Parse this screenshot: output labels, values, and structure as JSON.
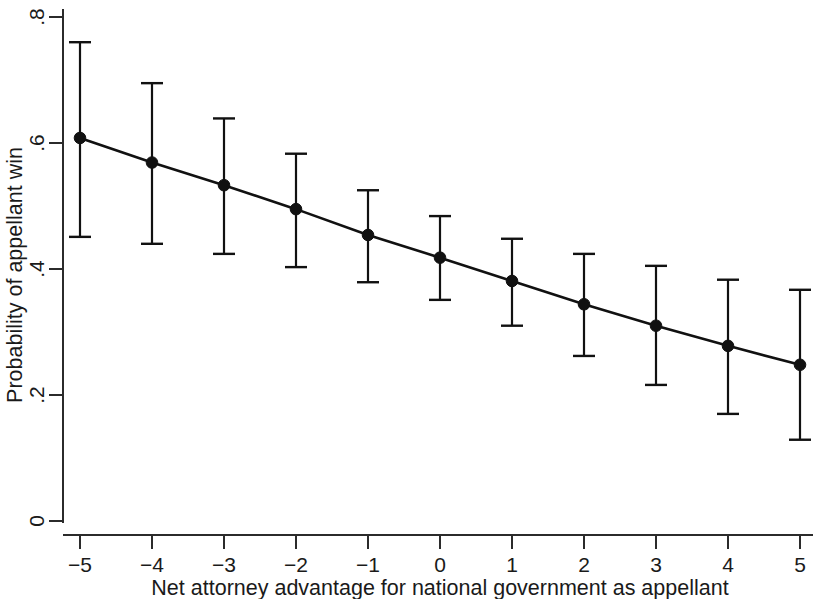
{
  "chart_data": {
    "type": "line",
    "title": "",
    "subtitle": "",
    "xlabel": "Net attorney advantage for national government as appellant",
    "ylabel": "Probability of appellant win",
    "x": [
      -5,
      -4,
      -3,
      -2,
      -1,
      0,
      1,
      2,
      3,
      4,
      5
    ],
    "xticklabels": [
      "−5",
      "−4",
      "−3",
      "−2",
      "−1",
      "0",
      "1",
      "2",
      "3",
      "4",
      "5"
    ],
    "yticklabels": [
      "0",
      ".2",
      ".4",
      ".6",
      ".8"
    ],
    "yticks": [
      0,
      0.2,
      0.4,
      0.6,
      0.8
    ],
    "xlim": [
      -5.35,
      5.2
    ],
    "ylim": [
      0,
      0.8
    ],
    "grid": false,
    "legend": null,
    "marker": "filled-circle",
    "errorbars": true,
    "series": [
      {
        "name": "Predicted probability of appellant win",
        "values": [
          0.608,
          0.569,
          0.533,
          0.495,
          0.454,
          0.418,
          0.381,
          0.344,
          0.31,
          0.278,
          0.248
        ],
        "ci_lower": [
          0.451,
          0.44,
          0.424,
          0.403,
          0.379,
          0.351,
          0.31,
          0.262,
          0.216,
          0.17,
          0.129
        ],
        "ci_upper": [
          0.76,
          0.695,
          0.639,
          0.583,
          0.525,
          0.484,
          0.448,
          0.424,
          0.405,
          0.383,
          0.367
        ],
        "color": "#111111"
      }
    ]
  },
  "axes": {
    "y_axis_label": "Probability of appellant win",
    "x_axis_label": "Net attorney advantage for national government as appellant"
  }
}
